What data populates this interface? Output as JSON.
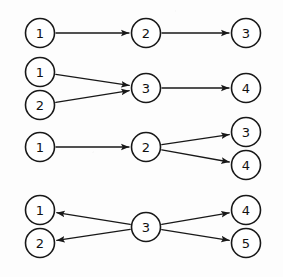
{
  "figure": {
    "background_color": "#fdfdfd",
    "stroke_color": "#181818",
    "node_fill_color": "#ffffff",
    "node_radius": 14.5,
    "width": 283,
    "height": 277
  },
  "chart_data": {
    "type": "diagram",
    "subtype": "directed-graph",
    "xlabel": "",
    "ylabel": "",
    "grid": false,
    "legend": null,
    "groups": [
      {
        "name": "chain",
        "description": "linear chain 1 to 2 to 3",
        "nodes": [
          {
            "id": "g1n1",
            "label": "1",
            "x": 40,
            "y": 33
          },
          {
            "id": "g1n2",
            "label": "2",
            "x": 146,
            "y": 33
          },
          {
            "id": "g1n3",
            "label": "3",
            "x": 246,
            "y": 33
          }
        ],
        "edges": [
          {
            "from": "g1n1",
            "to": "g1n2",
            "directed": true
          },
          {
            "from": "g1n2",
            "to": "g1n3",
            "directed": true
          }
        ]
      },
      {
        "name": "fan-in",
        "description": "nodes 1 and 2 converge into 3 which points to 4",
        "nodes": [
          {
            "id": "g2n1",
            "label": "1",
            "x": 40,
            "y": 72
          },
          {
            "id": "g2n2",
            "label": "2",
            "x": 40,
            "y": 105
          },
          {
            "id": "g2n3",
            "label": "3",
            "x": 146,
            "y": 88
          },
          {
            "id": "g2n4",
            "label": "4",
            "x": 246,
            "y": 88
          }
        ],
        "edges": [
          {
            "from": "g2n1",
            "to": "g2n3",
            "directed": true
          },
          {
            "from": "g2n2",
            "to": "g2n3",
            "directed": true
          },
          {
            "from": "g2n3",
            "to": "g2n4",
            "directed": true
          }
        ]
      },
      {
        "name": "fan-out",
        "description": "node 1 points to 2 which diverges to 3 and 4",
        "nodes": [
          {
            "id": "g3n1",
            "label": "1",
            "x": 40,
            "y": 147
          },
          {
            "id": "g3n2",
            "label": "2",
            "x": 146,
            "y": 147
          },
          {
            "id": "g3n3",
            "label": "3",
            "x": 246,
            "y": 132
          },
          {
            "id": "g3n4",
            "label": "4",
            "x": 246,
            "y": 165
          }
        ],
        "edges": [
          {
            "from": "g3n1",
            "to": "g3n2",
            "directed": true
          },
          {
            "from": "g3n2",
            "to": "g3n3",
            "directed": true
          },
          {
            "from": "g3n2",
            "to": "g3n4",
            "directed": true
          }
        ]
      },
      {
        "name": "hub-out",
        "description": "central node 3 points outward to 1 and 2 on the left and 4 and 5 on the right",
        "nodes": [
          {
            "id": "g4n1",
            "label": "1",
            "x": 40,
            "y": 210
          },
          {
            "id": "g4n2",
            "label": "2",
            "x": 40,
            "y": 243
          },
          {
            "id": "g4n3",
            "label": "3",
            "x": 146,
            "y": 227
          },
          {
            "id": "g4n4",
            "label": "4",
            "x": 246,
            "y": 210
          },
          {
            "id": "g4n5",
            "label": "5",
            "x": 246,
            "y": 243
          }
        ],
        "edges": [
          {
            "from": "g4n3",
            "to": "g4n1",
            "directed": true
          },
          {
            "from": "g4n3",
            "to": "g4n2",
            "directed": true
          },
          {
            "from": "g4n3",
            "to": "g4n4",
            "directed": true
          },
          {
            "from": "g4n3",
            "to": "g4n5",
            "directed": true
          }
        ]
      }
    ]
  }
}
